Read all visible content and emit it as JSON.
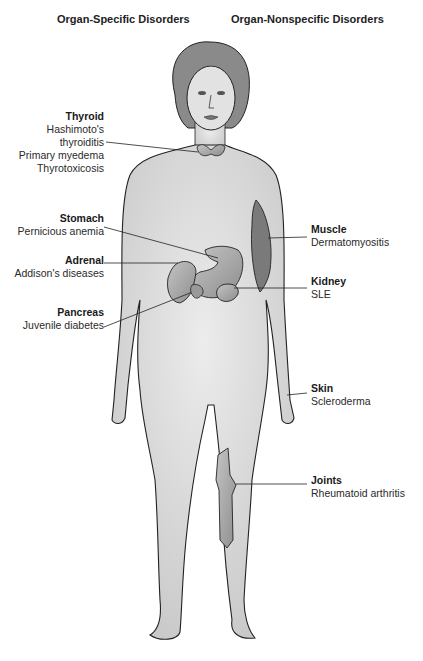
{
  "headings": {
    "left": "Organ-Specific Disorders",
    "right": "Organ-Nonspecific Disorders"
  },
  "organ_specific": [
    {
      "organ": "Thyroid",
      "disorders": [
        "Hashimoto's",
        "thyroiditis",
        "Primary myedema",
        "Thyrotoxicosis"
      ]
    },
    {
      "organ": "Stomach",
      "disorders": [
        "Pernicious anemia"
      ]
    },
    {
      "organ": "Adrenal",
      "disorders": [
        "Addison's diseases"
      ]
    },
    {
      "organ": "Pancreas",
      "disorders": [
        "Juvenile diabetes"
      ]
    }
  ],
  "organ_nonspecific": [
    {
      "organ": "Muscle",
      "disorders": [
        "Dermatomyositis"
      ]
    },
    {
      "organ": "Kidney",
      "disorders": [
        "SLE"
      ]
    },
    {
      "organ": "Skin",
      "disorders": [
        "Scleroderma"
      ]
    },
    {
      "organ": "Joints",
      "disorders": [
        "Rheumatoid arthritis"
      ]
    }
  ],
  "colors": {
    "skin": "#d9d9d9",
    "outline": "#222222",
    "organ": "#a8a8a8",
    "hair": "#8a8a8a"
  }
}
